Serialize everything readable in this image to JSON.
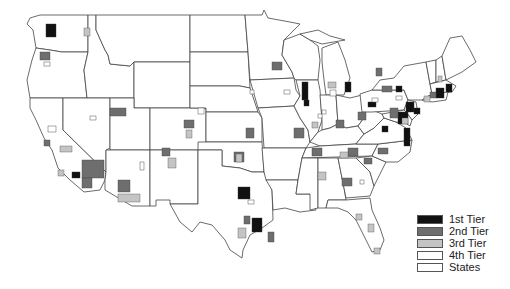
{
  "map": {
    "title": "",
    "colors": {
      "tier1": "#111111",
      "tier2": "#6e6e6e",
      "tier3": "#c4c4c4",
      "tier4": "#ffffff",
      "states": "#ffffff",
      "border": "#444444"
    }
  },
  "legend": {
    "items": [
      {
        "label": "1st Tier",
        "color": "#111111"
      },
      {
        "label": "2nd Tier",
        "color": "#6e6e6e"
      },
      {
        "label": "3rd Tier",
        "color": "#c4c4c4"
      },
      {
        "label": "4th Tier",
        "color": "#ffffff"
      },
      {
        "label": "States",
        "color": "#ffffff"
      }
    ]
  }
}
